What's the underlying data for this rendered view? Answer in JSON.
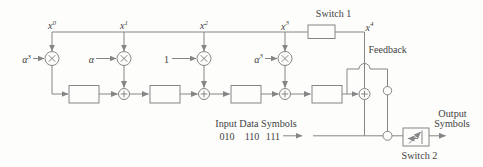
{
  "colors": {
    "line": "#858585",
    "text": "#3f3f3f",
    "background": "#fdfdfc"
  },
  "rail_labels": [
    {
      "base": "x",
      "sup": "0"
    },
    {
      "base": "x",
      "sup": "1"
    },
    {
      "base": "x",
      "sup": "2"
    },
    {
      "base": "x",
      "sup": "3"
    },
    {
      "base": "x",
      "sup": "4"
    }
  ],
  "coefficients": [
    {
      "base": "α",
      "sup": "3"
    },
    {
      "base": "α",
      "sup": ""
    },
    {
      "base": "1",
      "sup": ""
    },
    {
      "base": "α",
      "sup": "3"
    }
  ],
  "switch1": {
    "label": "Switch 1"
  },
  "switch2": {
    "label": "Switch 2"
  },
  "feedback": {
    "label": "Feedback"
  },
  "input": {
    "title": "Input Data Symbols",
    "symbols": [
      "010",
      "110",
      "111"
    ]
  },
  "output": {
    "label_line1": "Output",
    "label_line2": "Symbols"
  },
  "icons": {
    "multiplier": "circle-times-icon",
    "adder": "circle-plus-icon",
    "switch2_glyph": "toggle-arrows-icon",
    "crossover": "hop-bump"
  }
}
